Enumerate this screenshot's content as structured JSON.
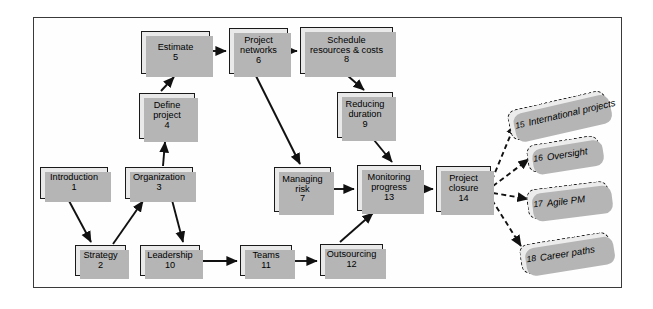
{
  "diagram": {
    "frame": {
      "border_color": "#3a3a3a",
      "fill": "#fefefe"
    },
    "node_style": {
      "fill": "#e9e9e9",
      "border": "#1a1a1a",
      "shadow": "#b5b5b5"
    },
    "cloud_style": {
      "fill": "#ececec",
      "border": "#1a1a1a",
      "shadow": "#b5b5b5"
    },
    "nodes": [
      {
        "id": "n5",
        "title": "Estimate",
        "num": "5",
        "x": 141,
        "y": 31,
        "w": 69,
        "h": 43
      },
      {
        "id": "n6",
        "title": "Project\nnetworks",
        "num": "6",
        "x": 229,
        "y": 28,
        "w": 59,
        "h": 46
      },
      {
        "id": "n8",
        "title": "Schedule\nresources & costs",
        "num": "8",
        "x": 300,
        "y": 27,
        "w": 93,
        "h": 47
      },
      {
        "id": "n4",
        "title": "Define\nproject",
        "num": "4",
        "x": 139,
        "y": 93,
        "w": 56,
        "h": 46
      },
      {
        "id": "n9",
        "title": "Reducing\nduration",
        "num": "9",
        "x": 337,
        "y": 92,
        "w": 56,
        "h": 46
      },
      {
        "id": "n1",
        "title": "Introduction",
        "num": "1",
        "x": 40,
        "y": 167,
        "w": 68,
        "h": 32
      },
      {
        "id": "n3",
        "title": "Organization",
        "num": "3",
        "x": 125,
        "y": 167,
        "w": 68,
        "h": 32
      },
      {
        "id": "n7",
        "title": "Managing\nrisk",
        "num": "7",
        "x": 274,
        "y": 167,
        "w": 57,
        "h": 45
      },
      {
        "id": "n13",
        "title": "Monitoring\nprogress",
        "num": "13",
        "x": 357,
        "y": 165,
        "w": 64,
        "h": 46
      },
      {
        "id": "n14",
        "title": "Project\nclosure",
        "num": "14",
        "x": 436,
        "y": 166,
        "w": 55,
        "h": 46
      },
      {
        "id": "n2",
        "title": "Strategy",
        "num": "2",
        "x": 75,
        "y": 245,
        "w": 51,
        "h": 31
      },
      {
        "id": "n10",
        "title": "Leadership",
        "num": "10",
        "x": 140,
        "y": 245,
        "w": 60,
        "h": 31
      },
      {
        "id": "n11",
        "title": "Teams",
        "num": "11",
        "x": 240,
        "y": 245,
        "w": 52,
        "h": 31
      },
      {
        "id": "n12",
        "title": "Outsourcing",
        "num": "12",
        "x": 320,
        "y": 244,
        "w": 63,
        "h": 32
      }
    ],
    "clouds": [
      {
        "id": "c15",
        "num": "15",
        "label": "International projects",
        "x": 508,
        "y": 100,
        "w": 100,
        "h": 31,
        "rot": -13
      },
      {
        "id": "c16",
        "num": "16",
        "label": "Oversight",
        "x": 527,
        "y": 140,
        "w": 73,
        "h": 28,
        "rot": -9
      },
      {
        "id": "c17",
        "num": "17",
        "label": "Agile PM",
        "x": 527,
        "y": 185,
        "w": 82,
        "h": 30,
        "rot": -7
      },
      {
        "id": "c18",
        "num": "18",
        "label": "Career paths",
        "x": 520,
        "y": 238,
        "w": 91,
        "h": 30,
        "rot": -9
      }
    ],
    "edges": [
      {
        "from": "n1",
        "to": "n2",
        "style": "solid"
      },
      {
        "from": "n2",
        "to": "n3",
        "style": "solid"
      },
      {
        "from": "n3",
        "to": "n4",
        "style": "solid"
      },
      {
        "from": "n3",
        "to": "n10",
        "style": "solid"
      },
      {
        "from": "n4",
        "to": "n5",
        "style": "solid"
      },
      {
        "from": "n5",
        "to": "n6",
        "style": "solid"
      },
      {
        "from": "n6",
        "to": "n8",
        "style": "solid"
      },
      {
        "from": "n6",
        "to": "n7",
        "style": "solid"
      },
      {
        "from": "n8",
        "to": "n9",
        "style": "solid"
      },
      {
        "from": "n9",
        "to": "n13",
        "style": "solid"
      },
      {
        "from": "n7",
        "to": "n13",
        "style": "solid"
      },
      {
        "from": "n10",
        "to": "n11",
        "style": "solid"
      },
      {
        "from": "n11",
        "to": "n12",
        "style": "solid"
      },
      {
        "from": "n12",
        "to": "n13",
        "style": "solid"
      },
      {
        "from": "n13",
        "to": "n14",
        "style": "solid"
      },
      {
        "from": "n14",
        "to": "c15",
        "style": "dashed"
      },
      {
        "from": "n14",
        "to": "c16",
        "style": "dashed"
      },
      {
        "from": "n14",
        "to": "c17",
        "style": "dashed"
      },
      {
        "from": "n14",
        "to": "c18",
        "style": "dashed"
      }
    ]
  }
}
